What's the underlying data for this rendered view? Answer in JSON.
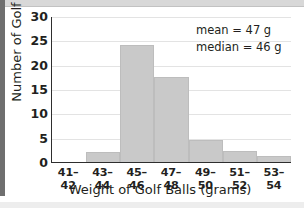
{
  "chart_data": {
    "type": "bar",
    "title": "",
    "subtitle": "",
    "xlabel": "Weight of Golf Balls (grams)",
    "ylabel": "Number of Golf Balls",
    "categories": [
      "41–42",
      "43–44",
      "45–46",
      "47–48",
      "49–50",
      "51–52",
      "53–54"
    ],
    "values": [
      0,
      2,
      24,
      17.5,
      4.5,
      2.3,
      1.2
    ],
    "ylim": [
      0,
      30
    ],
    "yticks": [
      0,
      5,
      10,
      15,
      20,
      25,
      30
    ],
    "ytick_labels": [
      "0",
      "5",
      "10",
      "15",
      "20",
      "25",
      "30"
    ],
    "grid": "horizontal",
    "legend": "none",
    "annotations": [
      "mean = 47 g",
      "median = 46 g"
    ],
    "bar_color": "#c9c9c9",
    "bar_edge_color": "#bdbdbd",
    "axis_color": "#2e2e2e",
    "gridline_color": "#e3e3e3",
    "text_color": "#231f20",
    "background_color": "#ffffff"
  },
  "statistics": {
    "mean_label": "mean = 47 g",
    "median_label": "median = 46 g"
  }
}
